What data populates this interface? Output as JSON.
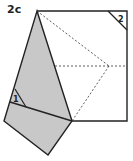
{
  "diagram": {
    "step_label": "2c",
    "markers": [
      {
        "id": "fold-1",
        "label": "1"
      },
      {
        "id": "fold-2",
        "label": "2"
      }
    ],
    "colors": {
      "paper": "#ffffff",
      "folded": "#c8c8c8",
      "line": "#222222",
      "dashed": "#333333"
    }
  }
}
